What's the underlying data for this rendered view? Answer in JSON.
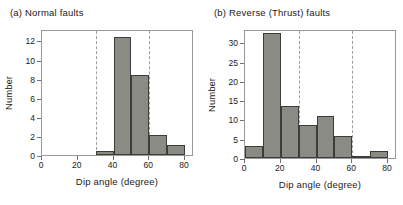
{
  "figure": {
    "background": "#ffffff",
    "bar_fill": "#8b8b86",
    "bar_stroke": "#3c3c3a",
    "frame_color": "#9a9a9a",
    "gridline_color": "#9e9e9e"
  },
  "chart_data": [
    {
      "type": "bar",
      "panel_label": "(a)",
      "title": "(a)  Normal faults",
      "title_text": "Normal faults",
      "xlabel": "Dip angle  (degree)",
      "ylabel": "Number",
      "xlim": [
        0,
        85
      ],
      "ylim": [
        0,
        13.2
      ],
      "xticks": [
        0,
        20,
        40,
        60,
        80
      ],
      "xticklabels": [
        "0",
        "20",
        "40",
        "60",
        "80"
      ],
      "yticks": [
        0,
        2,
        4,
        6,
        8,
        10,
        12
      ],
      "yticklabels": [
        "0",
        "2",
        "4",
        "6",
        "8",
        "10",
        "12"
      ],
      "grid": false,
      "legend": "none",
      "reference_lines": [
        30,
        60
      ],
      "bin_width": 10,
      "bin_edges": [
        30,
        40,
        50,
        60,
        70,
        80
      ],
      "categories": [
        "30-40",
        "40-50",
        "50-60",
        "60-70",
        "70-80"
      ],
      "values": [
        0.4,
        12.4,
        8.4,
        2.1,
        1.0
      ]
    },
    {
      "type": "bar",
      "panel_label": "(b)",
      "title": "(b)  Reverse  (Thrust)  faults",
      "title_text": "Reverse  (Thrust)  faults",
      "xlabel": "Dip angle  (degree)",
      "ylabel": "Number",
      "xlim": [
        0,
        85
      ],
      "ylim": [
        0,
        33.5
      ],
      "xticks": [
        0,
        20,
        40,
        60,
        80
      ],
      "xticklabels": [
        "0",
        "20",
        "40",
        "60",
        "80"
      ],
      "yticks": [
        0,
        5,
        10,
        15,
        20,
        25,
        30
      ],
      "yticklabels": [
        "0",
        "5",
        "10",
        "15",
        "20",
        "25",
        "30"
      ],
      "grid": false,
      "legend": "none",
      "reference_lines": [
        30,
        60
      ],
      "bin_width": 10,
      "bin_edges": [
        0,
        10,
        20,
        30,
        40,
        50,
        60,
        70,
        80
      ],
      "categories": [
        "0-10",
        "10-20",
        "20-30",
        "30-40",
        "40-50",
        "50-60",
        "60-70",
        "70-80"
      ],
      "values": [
        3.0,
        32.5,
        13.5,
        8.7,
        11.0,
        5.7,
        0.6,
        1.8
      ]
    }
  ]
}
